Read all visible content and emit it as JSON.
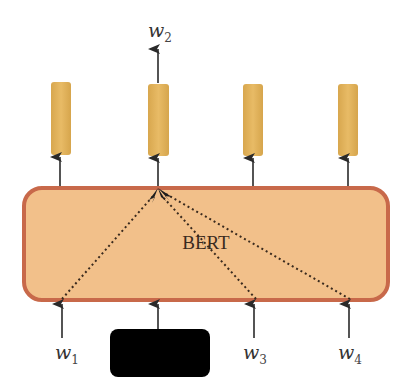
{
  "diagram": {
    "type": "masked-language-model",
    "encoder": {
      "label": "BERT",
      "fill_color": "#f2c08a",
      "border_color": "#c8694a"
    },
    "output_vectors": {
      "count": 4,
      "fill_color": "#e3b45c"
    },
    "predicted_output": {
      "base": "w",
      "subscript": "2"
    },
    "inputs": [
      {
        "base": "w",
        "subscript": "1",
        "masked": false
      },
      {
        "base": "",
        "subscript": "",
        "masked": true
      },
      {
        "base": "w",
        "subscript": "3",
        "masked": false
      },
      {
        "base": "w",
        "subscript": "4",
        "masked": false
      }
    ],
    "mask_color": "#000000",
    "attention_edges": [
      {
        "from": "input-1",
        "to": "output-2",
        "style": "dotted"
      },
      {
        "from": "input-3",
        "to": "output-2",
        "style": "dotted"
      },
      {
        "from": "input-4",
        "to": "output-2",
        "style": "dotted"
      }
    ]
  }
}
